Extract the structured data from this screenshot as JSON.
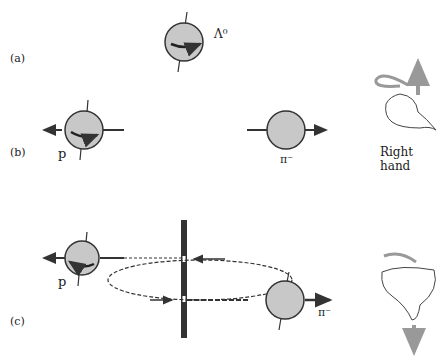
{
  "figure": {
    "panels": [
      {
        "id": "a",
        "label": "(a)",
        "particle": "Λ⁰"
      },
      {
        "id": "b",
        "label": "(b)",
        "particles": [
          "p",
          "π⁻"
        ],
        "hand_label": "Right hand"
      },
      {
        "id": "c",
        "label": "(c)",
        "particles": [
          "p",
          "π⁻"
        ]
      }
    ],
    "colors": {
      "sphere_fill": "#c8c8c8",
      "stroke": "#333333",
      "arrow_gray": "#999999"
    }
  }
}
